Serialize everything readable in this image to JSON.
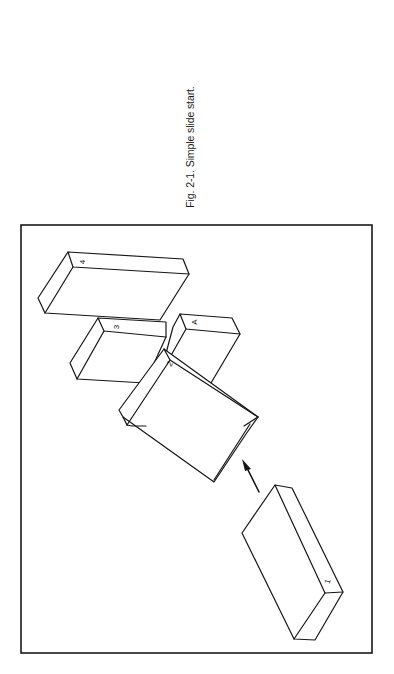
{
  "figure": {
    "caption": "Fig. 2-1. Simple slide start.",
    "orientation": "rotated 90 degrees counter-clockwise",
    "blocks": [
      {
        "id": "block-1",
        "label": "1"
      },
      {
        "id": "block-2",
        "label": "2"
      },
      {
        "id": "block-3",
        "label": "3"
      },
      {
        "id": "block-4",
        "label": "4"
      },
      {
        "id": "block-A",
        "label": "A"
      }
    ],
    "arrow": "movement-arrow",
    "colors": {
      "ink": "#161616",
      "background": "#ffffff"
    }
  }
}
